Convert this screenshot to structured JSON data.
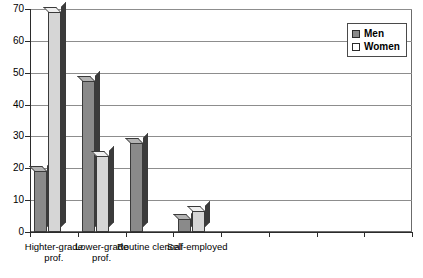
{
  "chart_data": {
    "type": "bar",
    "title": "",
    "xlabel": "",
    "ylabel": "",
    "ylim": [
      0,
      70
    ],
    "yticks": [
      0,
      10,
      20,
      30,
      40,
      50,
      60,
      70
    ],
    "grid": true,
    "legend_position": "top-right",
    "categories": [
      "Highter-grade prof.",
      "Lower-grade prof.",
      "Routine clerical",
      "Self-employed",
      "",
      "",
      "",
      ""
    ],
    "series": [
      {
        "name": "Men",
        "color": "#8a8a8a",
        "values": [
          19,
          47.5,
          28,
          4,
          0,
          0,
          0,
          0
        ]
      },
      {
        "name": "Women",
        "color": "#d6d6d6",
        "values": [
          69,
          24,
          0,
          6.5,
          0,
          0,
          0,
          0
        ]
      }
    ]
  },
  "legend": {
    "items": [
      {
        "label": "Men",
        "swatch": "men-swatch"
      },
      {
        "label": "Women",
        "swatch": "women-swatch"
      }
    ]
  }
}
